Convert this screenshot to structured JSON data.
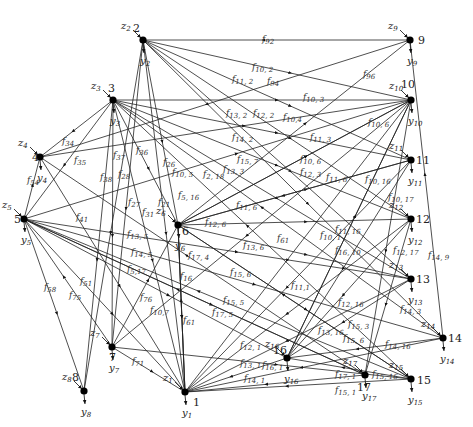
{
  "diagram": {
    "type": "directed-network",
    "nodes": [
      {
        "id": "1",
        "x": 185,
        "y": 392,
        "label_dx": 8,
        "label_dy": 14,
        "z": "z",
        "z_sub": "1",
        "y_var": "y",
        "y_sub": "1"
      },
      {
        "id": "2",
        "x": 143,
        "y": 40,
        "label_dx": -10,
        "label_dy": -8,
        "z": "z",
        "z_sub": "2",
        "y_var": "y",
        "y_sub": "2"
      },
      {
        "id": "3",
        "x": 113,
        "y": 100,
        "label_dx": -5,
        "label_dy": -8,
        "z": "z",
        "z_sub": "3",
        "y_var": "y",
        "y_sub": "3"
      },
      {
        "id": "4",
        "x": 40,
        "y": 157,
        "label_dx": -8,
        "label_dy": 4,
        "z": "z",
        "z_sub": "4",
        "y_var": "y",
        "y_sub": "4"
      },
      {
        "id": "5",
        "x": 24,
        "y": 219,
        "label_dx": -10,
        "label_dy": 4,
        "z": "z",
        "z_sub": "5",
        "y_var": "y",
        "y_sub": "5"
      },
      {
        "id": "6",
        "x": 178,
        "y": 225,
        "label_dx": 4,
        "label_dy": 10,
        "z": "z",
        "z_sub": "6",
        "y_var": "y",
        "y_sub": "6"
      },
      {
        "id": "7",
        "x": 112,
        "y": 347,
        "label_dx": -3,
        "label_dy": 14,
        "z": "z",
        "z_sub": "7",
        "y_var": "y",
        "y_sub": "7"
      },
      {
        "id": "8",
        "x": 84,
        "y": 391,
        "label_dx": -12,
        "label_dy": -10,
        "z": "z",
        "z_sub": "8",
        "y_var": "y",
        "y_sub": "8"
      },
      {
        "id": "9",
        "x": 410,
        "y": 40,
        "label_dx": 8,
        "label_dy": 4,
        "z": "z",
        "z_sub": "9",
        "y_var": "y",
        "y_sub": "9"
      },
      {
        "id": "10",
        "x": 411,
        "y": 100,
        "label_dx": -10,
        "label_dy": -12,
        "z": "z",
        "z_sub": "10",
        "y_var": "y",
        "y_sub": "10"
      },
      {
        "id": "11",
        "x": 411,
        "y": 160,
        "label_dx": 5,
        "label_dy": 4,
        "z": "z",
        "z_sub": "11",
        "y_var": "y",
        "y_sub": "11"
      },
      {
        "id": "12",
        "x": 411,
        "y": 219,
        "label_dx": 5,
        "label_dy": 4,
        "z": "z",
        "z_sub": "12",
        "y_var": "y",
        "y_sub": "12"
      },
      {
        "id": "13",
        "x": 411,
        "y": 279,
        "label_dx": 5,
        "label_dy": 4,
        "z": "z",
        "z_sub": "13",
        "y_var": "y",
        "y_sub": "13"
      },
      {
        "id": "14",
        "x": 443,
        "y": 338,
        "label_dx": 5,
        "label_dy": 4,
        "z": "z",
        "z_sub": "14",
        "y_var": "y",
        "y_sub": "14"
      },
      {
        "id": "15",
        "x": 411,
        "y": 379,
        "label_dx": 6,
        "label_dy": 5,
        "z": "z",
        "z_sub": "15",
        "y_var": "y",
        "y_sub": "15"
      },
      {
        "id": "16",
        "x": 287,
        "y": 358,
        "label_dx": -14,
        "label_dy": -4,
        "z": "z",
        "z_sub": "16",
        "y_var": "y",
        "y_sub": "16"
      },
      {
        "id": "17",
        "x": 365,
        "y": 375,
        "label_dx": -8,
        "label_dy": 16,
        "z": "z",
        "z_sub": "17",
        "y_var": "y",
        "y_sub": "17"
      }
    ],
    "edges": [
      {
        "from": "9",
        "to": "2",
        "label": "f",
        "sub": "92",
        "lx": 262,
        "ly": 42
      },
      {
        "from": "2",
        "to": "10",
        "label": "f",
        "sub": "10, 2",
        "lx": 252,
        "ly": 70
      },
      {
        "from": "2",
        "to": "11",
        "label": "f",
        "sub": "11, 2",
        "lx": 232,
        "ly": 82
      },
      {
        "from": "9",
        "to": "4",
        "label": "f",
        "sub": "94",
        "lx": 267,
        "ly": 84
      },
      {
        "from": "3",
        "to": "10",
        "label": "f",
        "sub": "10, 3",
        "lx": 303,
        "ly": 100
      },
      {
        "from": "2",
        "to": "13",
        "label": "f",
        "sub": "13, 2",
        "lx": 226,
        "ly": 116
      },
      {
        "from": "2",
        "to": "12",
        "label": "f",
        "sub": "12, 2",
        "lx": 253,
        "ly": 116
      },
      {
        "from": "4",
        "to": "10",
        "label": "f",
        "sub": "10,4",
        "lx": 283,
        "ly": 120
      },
      {
        "from": "2",
        "to": "14",
        "label": "f",
        "sub": "14, 2",
        "lx": 232,
        "ly": 140
      },
      {
        "from": "3",
        "to": "11",
        "label": "f",
        "sub": "11, 3",
        "lx": 310,
        "ly": 140
      },
      {
        "from": "6",
        "to": "9",
        "label": "f",
        "sub": "96",
        "lx": 363,
        "ly": 77
      },
      {
        "from": "6",
        "to": "10",
        "label": "f",
        "sub": "10, 6",
        "lx": 368,
        "ly": 125
      },
      {
        "from": "7",
        "to": "15",
        "label": "f",
        "sub": "15, 7",
        "lx": 237,
        "ly": 162
      },
      {
        "from": "6",
        "to": "10",
        "label": "f",
        "sub": "10, 6",
        "lx": 300,
        "ly": 162
      },
      {
        "from": "3",
        "to": "13",
        "label": "f",
        "sub": "13, 3",
        "lx": 223,
        "ly": 172
      },
      {
        "from": "3",
        "to": "12",
        "label": "f",
        "sub": "12, 3",
        "lx": 300,
        "ly": 175
      },
      {
        "from": "6",
        "to": "11",
        "label": "f",
        "sub": "11, 6",
        "lx": 326,
        "ly": 180
      },
      {
        "from": "16",
        "to": "10",
        "label": "f",
        "sub": "10, 16",
        "lx": 365,
        "ly": 182
      },
      {
        "from": "3",
        "to": "4",
        "label": "f",
        "sub": "34",
        "lx": 62,
        "ly": 144
      },
      {
        "from": "3",
        "to": "5",
        "label": "f",
        "sub": "35",
        "lx": 74,
        "ly": 163
      },
      {
        "from": "3",
        "to": "7",
        "label": "f",
        "sub": "37",
        "lx": 113,
        "ly": 158
      },
      {
        "from": "3",
        "to": "6",
        "label": "f",
        "sub": "36",
        "lx": 136,
        "ly": 153
      },
      {
        "from": "2",
        "to": "6",
        "label": "f",
        "sub": "26",
        "lx": 163,
        "ly": 165
      },
      {
        "from": "5",
        "to": "10",
        "label": "f",
        "sub": "10, 5",
        "lx": 172,
        "ly": 175
      },
      {
        "from": "2",
        "to": "18",
        "label": "f",
        "sub": "2, 18",
        "lx": 203,
        "ly": 177
      },
      {
        "from": "5",
        "to": "4",
        "label": "f",
        "sub": "54",
        "lx": 27,
        "ly": 183
      },
      {
        "from": "3",
        "to": "8",
        "label": "f",
        "sub": "38",
        "lx": 100,
        "ly": 180
      },
      {
        "from": "2",
        "to": "8",
        "label": "f",
        "sub": "28",
        "lx": 118,
        "ly": 177
      },
      {
        "from": "2",
        "to": "7",
        "label": "f",
        "sub": "27",
        "lx": 128,
        "ly": 205
      },
      {
        "from": "3",
        "to": "1",
        "label": "f",
        "sub": "31",
        "lx": 142,
        "ly": 215
      },
      {
        "from": "2",
        "to": "1",
        "label": "f",
        "sub": "21",
        "lx": 158,
        "ly": 205
      },
      {
        "from": "5",
        "to": "16",
        "label": "f",
        "sub": "5, 16",
        "lx": 178,
        "ly": 198
      },
      {
        "from": "11",
        "to": "6",
        "label": "f",
        "sub": "11, 6",
        "lx": 236,
        "ly": 208
      },
      {
        "from": "6",
        "to": "12",
        "label": "f",
        "sub": "12, 6",
        "lx": 205,
        "ly": 225
      },
      {
        "from": "6",
        "to": "1",
        "label": "f",
        "sub": "61",
        "lx": 277,
        "ly": 241
      },
      {
        "from": "6",
        "to": "13",
        "label": "f",
        "sub": "13, 6",
        "lx": 243,
        "ly": 248
      },
      {
        "from": "4",
        "to": "1",
        "label": "f",
        "sub": "41",
        "lx": 76,
        "ly": 220
      },
      {
        "from": "5",
        "to": "13",
        "label": "f",
        "sub": "13, 5",
        "lx": 127,
        "ly": 237
      },
      {
        "from": "5",
        "to": "14",
        "label": "f",
        "sub": "14, 5",
        "lx": 131,
        "ly": 255
      },
      {
        "from": "5",
        "to": "17",
        "label": "f",
        "sub": "5,17",
        "lx": 127,
        "ly": 272
      },
      {
        "from": "17",
        "to": "4",
        "label": "f",
        "sub": "17, 4",
        "lx": 188,
        "ly": 258
      },
      {
        "from": "1",
        "to": "6",
        "label": "f",
        "sub": "16",
        "lx": 180,
        "ly": 279
      },
      {
        "from": "6",
        "to": "15",
        "label": "f",
        "sub": "15, 6",
        "lx": 230,
        "ly": 275
      },
      {
        "from": "10",
        "to": "1",
        "label": "f",
        "sub": "10, 1",
        "lx": 320,
        "ly": 238
      },
      {
        "from": "11",
        "to": "16",
        "label": "f",
        "sub": "11, 16",
        "lx": 335,
        "ly": 232
      },
      {
        "from": "10",
        "to": "17",
        "label": "f",
        "sub": "10, 17",
        "lx": 388,
        "ly": 200
      },
      {
        "from": "16",
        "to": "10",
        "label": "f",
        "sub": "16, 10",
        "lx": 335,
        "ly": 253
      },
      {
        "from": "12",
        "to": "17",
        "label": "f",
        "sub": "12, 17",
        "lx": 393,
        "ly": 253
      },
      {
        "from": "14",
        "to": "9",
        "label": "f",
        "sub": "14, 9",
        "lx": 428,
        "ly": 258
      },
      {
        "from": "5",
        "to": "8",
        "label": "f",
        "sub": "58",
        "lx": 44,
        "ly": 290
      },
      {
        "from": "5",
        "to": "1",
        "label": "f",
        "sub": "51",
        "lx": 80,
        "ly": 284
      },
      {
        "from": "7",
        "to": "5",
        "label": "f",
        "sub": "75",
        "lx": 69,
        "ly": 298
      },
      {
        "from": "7",
        "to": "6",
        "label": "f",
        "sub": "76",
        "lx": 140,
        "ly": 300
      },
      {
        "from": "10",
        "to": "7",
        "label": "f",
        "sub": "10,7",
        "lx": 150,
        "ly": 313
      },
      {
        "from": "6",
        "to": "1",
        "label": "f",
        "sub": "61",
        "lx": 183,
        "ly": 323
      },
      {
        "from": "15",
        "to": "5",
        "label": "f",
        "sub": "15, 5",
        "lx": 223,
        "ly": 303
      },
      {
        "from": "17",
        "to": "5",
        "label": "f",
        "sub": "17, 5",
        "lx": 212,
        "ly": 315
      },
      {
        "from": "11",
        "to": "1",
        "label": "f",
        "sub": "11,1",
        "lx": 291,
        "ly": 288
      },
      {
        "from": "12",
        "to": "16",
        "label": "f",
        "sub": "12, 16",
        "lx": 338,
        "ly": 305
      },
      {
        "from": "14",
        "to": "3",
        "label": "f",
        "sub": "14, 3",
        "lx": 400,
        "ly": 312
      },
      {
        "from": "15",
        "to": "3",
        "label": "f",
        "sub": "15, 3",
        "lx": 348,
        "ly": 327
      },
      {
        "from": "13",
        "to": "16",
        "label": "f",
        "sub": "13, 16",
        "lx": 318,
        "ly": 333
      },
      {
        "from": "15",
        "to": "6",
        "label": "f",
        "sub": "15, 6",
        "lx": 343,
        "ly": 341
      },
      {
        "from": "14",
        "to": "16",
        "label": "f",
        "sub": "14, 16",
        "lx": 385,
        "ly": 347
      },
      {
        "from": "12",
        "to": "1",
        "label": "f",
        "sub": "12, 1",
        "lx": 240,
        "ly": 348
      },
      {
        "from": "7",
        "to": "1",
        "label": "f",
        "sub": "71",
        "lx": 132,
        "ly": 364
      },
      {
        "from": "13",
        "to": "1",
        "label": "f",
        "sub": "13, 1",
        "lx": 240,
        "ly": 366
      },
      {
        "from": "16",
        "to": "1",
        "label": "f",
        "sub": "16, 1",
        "lx": 262,
        "ly": 368
      },
      {
        "from": "14",
        "to": "1",
        "label": "f",
        "sub": "14, 1",
        "lx": 244,
        "ly": 381
      },
      {
        "from": "17",
        "to": "1",
        "label": "f",
        "sub": "17, 1",
        "lx": 335,
        "ly": 377
      },
      {
        "from": "15",
        "to": "16",
        "label": "f",
        "sub": "15, 16",
        "lx": 372,
        "ly": 377
      },
      {
        "from": "15",
        "to": "1",
        "label": "f",
        "sub": "15, 1",
        "lx": 335,
        "ly": 393
      }
    ]
  }
}
